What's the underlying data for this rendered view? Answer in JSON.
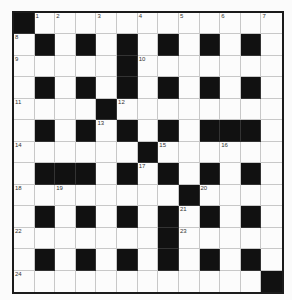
{
  "puzzle": {
    "rows": 13,
    "cols": 13,
    "layout": [
      "#............",
      ".#.#.#.#.#.#.",
      ".....#.......",
      ".#.#.#.#.#.#.",
      "....#........",
      ".#.#.#.#.###.",
      "......#......",
      ".###.#.#.#.#.",
      "........#....",
      ".#.#.#.#.#.#.",
      ".......#.....",
      ".#.#.#.#.#.#.",
      "............#"
    ],
    "numbers": [
      {
        "r": 0,
        "c": 1,
        "n": "1"
      },
      {
        "r": 0,
        "c": 2,
        "n": "2"
      },
      {
        "r": 0,
        "c": 4,
        "n": "3"
      },
      {
        "r": 0,
        "c": 6,
        "n": "4"
      },
      {
        "r": 0,
        "c": 8,
        "n": "5"
      },
      {
        "r": 0,
        "c": 10,
        "n": "6"
      },
      {
        "r": 0,
        "c": 12,
        "n": "7"
      },
      {
        "r": 1,
        "c": 0,
        "n": "8"
      },
      {
        "r": 2,
        "c": 0,
        "n": "9"
      },
      {
        "r": 2,
        "c": 6,
        "n": "10"
      },
      {
        "r": 4,
        "c": 0,
        "n": "11"
      },
      {
        "r": 4,
        "c": 5,
        "n": "12"
      },
      {
        "r": 5,
        "c": 4,
        "n": "13"
      },
      {
        "r": 6,
        "c": 0,
        "n": "14"
      },
      {
        "r": 6,
        "c": 7,
        "n": "15"
      },
      {
        "r": 6,
        "c": 10,
        "n": "16"
      },
      {
        "r": 7,
        "c": 6,
        "n": "17"
      },
      {
        "r": 8,
        "c": 0,
        "n": "18"
      },
      {
        "r": 8,
        "c": 2,
        "n": "19"
      },
      {
        "r": 8,
        "c": 9,
        "n": "20"
      },
      {
        "r": 9,
        "c": 8,
        "n": "21"
      },
      {
        "r": 10,
        "c": 0,
        "n": "22"
      },
      {
        "r": 10,
        "c": 8,
        "n": "23"
      },
      {
        "r": 12,
        "c": 0,
        "n": "24"
      }
    ]
  }
}
